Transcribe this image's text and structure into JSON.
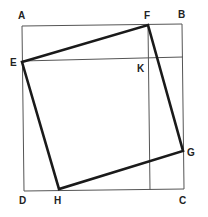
{
  "diagram": {
    "title": "",
    "colors": {
      "thin_line": "#555555",
      "thick_line": "#1a1a1a",
      "label": "#222222",
      "background": "#ffffff"
    },
    "points": {
      "A": {
        "label": "A",
        "x": 22,
        "y": 26
      },
      "B": {
        "label": "B",
        "x": 182,
        "y": 24
      },
      "C": {
        "label": "C",
        "x": 184,
        "y": 189
      },
      "D": {
        "label": "D",
        "x": 24,
        "y": 191
      },
      "E": {
        "label": "E",
        "x": 22,
        "y": 62
      },
      "F": {
        "label": "F",
        "x": 148,
        "y": 25
      },
      "G": {
        "label": "G",
        "x": 183,
        "y": 151
      },
      "H": {
        "label": "H",
        "x": 59,
        "y": 189
      },
      "K": {
        "label": "K",
        "x": 148,
        "y": 59
      }
    },
    "outer_square": [
      "A",
      "B",
      "C",
      "D"
    ],
    "inner_square": [
      "E",
      "F",
      "G",
      "H"
    ],
    "guide_lines": [
      {
        "from": "E",
        "to": "right-edge",
        "y": 59
      },
      {
        "from": "F",
        "to": "bottom-edge",
        "x": 148
      }
    ]
  }
}
